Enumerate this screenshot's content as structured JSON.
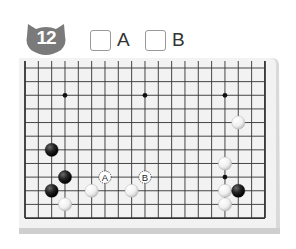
{
  "problem": {
    "number": "12",
    "badge_color": "#7a7a7a"
  },
  "choices": [
    {
      "id": "A",
      "label": "A",
      "checked": false
    },
    {
      "id": "B",
      "label": "B",
      "checked": false
    }
  ],
  "board": {
    "visible_columns": 19,
    "visible_rows": 12,
    "edges_shown": [
      "left",
      "right",
      "bottom"
    ],
    "surface_color": "#f2f2f2",
    "line_color": "#333333",
    "star_points": [
      [
        3,
        2
      ],
      [
        9,
        2
      ],
      [
        15,
        2
      ],
      [
        15,
        8
      ]
    ],
    "stones": [
      {
        "color": "black",
        "col": 2,
        "row": 6
      },
      {
        "color": "black",
        "col": 3,
        "row": 8
      },
      {
        "color": "black",
        "col": 2,
        "row": 9
      },
      {
        "color": "white",
        "col": 3,
        "row": 10
      },
      {
        "color": "white",
        "col": 5,
        "row": 9
      },
      {
        "color": "white",
        "col": 8,
        "row": 9
      },
      {
        "color": "white",
        "col": 16,
        "row": 4
      },
      {
        "color": "white",
        "col": 15,
        "row": 7
      },
      {
        "color": "white",
        "col": 15,
        "row": 9
      },
      {
        "color": "black",
        "col": 16,
        "row": 9
      },
      {
        "color": "white",
        "col": 15,
        "row": 10
      }
    ],
    "markers": [
      {
        "label": "A",
        "col": 6,
        "row": 8
      },
      {
        "label": "B",
        "col": 9,
        "row": 8
      }
    ]
  }
}
